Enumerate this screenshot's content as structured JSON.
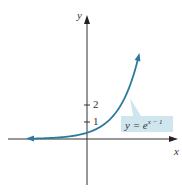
{
  "chart_data": {
    "type": "line",
    "title": "",
    "xlabel": "x",
    "ylabel": "y",
    "series": [
      {
        "name": "y = e^(x - 1)",
        "x": [
          -3,
          -2,
          -1,
          0,
          1,
          1.5,
          2,
          2.5
        ],
        "values": [
          0.018,
          0.05,
          0.135,
          0.368,
          1,
          1.65,
          2.72,
          4.48
        ]
      }
    ],
    "y_ticks": [
      "1",
      "2"
    ],
    "annotation": "y = e^(x - 1)",
    "xlim": [
      -4,
      4.5
    ],
    "ylim": [
      -3,
      7.5
    ],
    "grid": false,
    "colors": {
      "curve": "#2a7a9b",
      "axis": "#222222",
      "label_bg": "#cfe6ef"
    }
  },
  "labels": {
    "x_axis": "x",
    "y_axis": "y",
    "tick_1": "1",
    "tick_2": "2",
    "eq_y": "y = e",
    "eq_exp": "x − 1"
  }
}
